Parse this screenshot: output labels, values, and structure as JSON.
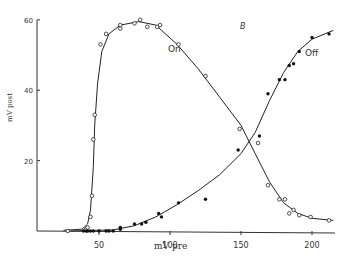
{
  "chart_data": {
    "type": "scatter",
    "title": "",
    "panel_label": "B",
    "xlabel": "mV pre",
    "ylabel": "mV post",
    "xlim": [
      0,
      220
    ],
    "ylim": [
      0,
      60
    ],
    "x_ticks": [
      50,
      100,
      150,
      200
    ],
    "y_ticks": [
      20,
      40,
      60
    ],
    "grid": false,
    "legend_position": "inline labels on curves",
    "series": [
      {
        "name": "On",
        "marker": "open-circle",
        "label_pos": [
          130,
          48
        ],
        "points": [
          [
            28,
            0
          ],
          [
            41,
            0.5
          ],
          [
            42,
            1
          ],
          [
            44,
            4
          ],
          [
            45,
            10
          ],
          [
            46,
            26
          ],
          [
            47,
            33
          ],
          [
            51,
            53
          ],
          [
            55,
            56
          ],
          [
            65,
            57.5
          ],
          [
            65,
            58.5
          ],
          [
            75,
            59
          ],
          [
            79,
            60
          ],
          [
            84,
            58
          ],
          [
            91,
            58
          ],
          [
            93,
            58.5
          ],
          [
            106,
            53
          ],
          [
            125,
            44
          ],
          [
            149,
            29
          ],
          [
            162,
            25
          ],
          [
            169,
            13
          ],
          [
            177,
            9
          ],
          [
            181,
            9
          ],
          [
            184,
            5
          ],
          [
            187,
            6
          ],
          [
            191,
            4.5
          ],
          [
            199,
            4
          ],
          [
            212,
            3
          ]
        ],
        "curve": [
          [
            25,
            0.2
          ],
          [
            38,
            0.5
          ],
          [
            42,
            2
          ],
          [
            44,
            6
          ],
          [
            46,
            18
          ],
          [
            47,
            30
          ],
          [
            49,
            42
          ],
          [
            52,
            51
          ],
          [
            57,
            56
          ],
          [
            65,
            58.5
          ],
          [
            78,
            59.5
          ],
          [
            90,
            58.5
          ],
          [
            105,
            53
          ],
          [
            120,
            46
          ],
          [
            135,
            38
          ],
          [
            150,
            30
          ],
          [
            160,
            22
          ],
          [
            170,
            14
          ],
          [
            180,
            8
          ],
          [
            190,
            5
          ],
          [
            200,
            3.6
          ],
          [
            215,
            3
          ]
        ]
      },
      {
        "name": "Off",
        "marker": "filled-circle",
        "label_pos": [
          190,
          44
        ],
        "points": [
          [
            39,
            0
          ],
          [
            41,
            0
          ],
          [
            42,
            0
          ],
          [
            44,
            0
          ],
          [
            46,
            0
          ],
          [
            50,
            0
          ],
          [
            55,
            0
          ],
          [
            57,
            0
          ],
          [
            60,
            0
          ],
          [
            65,
            0.5
          ],
          [
            65,
            1
          ],
          [
            75,
            2
          ],
          [
            80,
            2
          ],
          [
            83,
            2.5
          ],
          [
            92,
            5
          ],
          [
            94,
            4
          ],
          [
            106,
            8
          ],
          [
            125,
            9
          ],
          [
            148,
            23
          ],
          [
            163,
            27
          ],
          [
            169,
            39
          ],
          [
            177,
            43
          ],
          [
            181,
            43
          ],
          [
            184,
            47
          ],
          [
            187,
            47.5
          ],
          [
            191,
            51
          ],
          [
            200,
            55
          ],
          [
            212,
            56
          ]
        ],
        "curve": [
          [
            30,
            0
          ],
          [
            60,
            0.3
          ],
          [
            75,
            1.5
          ],
          [
            90,
            4
          ],
          [
            105,
            7.5
          ],
          [
            120,
            11.5
          ],
          [
            135,
            16
          ],
          [
            150,
            22
          ],
          [
            160,
            28
          ],
          [
            170,
            37
          ],
          [
            180,
            45
          ],
          [
            190,
            51
          ],
          [
            200,
            54.5
          ],
          [
            215,
            57
          ]
        ]
      }
    ]
  }
}
